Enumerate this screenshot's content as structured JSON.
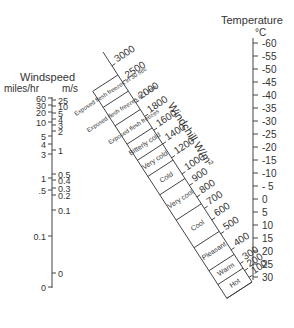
{
  "temperature": {
    "title": "Temperature",
    "unit": "°C",
    "ticks": [
      "-60",
      "-55",
      "-50",
      "-45",
      "-40",
      "-35",
      "-30",
      "-25",
      "-20",
      "-15",
      "-10",
      "- 5",
      "0",
      "5",
      "10",
      "15",
      "20",
      "25",
      "30"
    ]
  },
  "windspeed": {
    "title": "Windspeed",
    "unit_left": "miles/hr",
    "unit_right": "m/s",
    "mph_ticks": [
      "60",
      "30",
      "20",
      "10",
      "5",
      "4",
      "3",
      "1",
      ".5",
      "0.1",
      "0"
    ],
    "ms_ticks": [
      "25",
      "10",
      "5",
      "4",
      "3",
      "2",
      "1",
      "0.5",
      "0.4",
      "0.3",
      "0.2",
      "0.1",
      "0"
    ]
  },
  "windchill": {
    "title": "Windchill W/m²",
    "ticks": [
      "3000",
      "2500",
      "2000",
      "1800",
      "1600",
      "1400",
      "1200",
      "1000",
      "900",
      "800",
      "700",
      "600",
      "500",
      "400",
      "300",
      "200",
      "100"
    ],
    "bands": [
      "Exposed flesh freezes in 30 sec",
      "Exposed flesh freezes in 1 min",
      "Exposed flesh freezes",
      "Bitterly cold",
      "Very cold",
      "Cold",
      "Very cool",
      "Cool",
      "Pleasant",
      "Warm",
      "Hot"
    ]
  }
}
